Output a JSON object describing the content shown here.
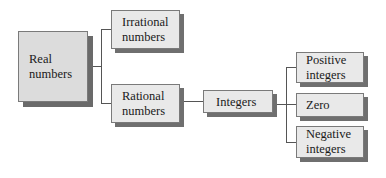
{
  "diagram": {
    "type": "tree",
    "nodes": {
      "real": {
        "line1": "Real",
        "line2": "numbers"
      },
      "irrational": {
        "line1": "Irrational",
        "line2": "numbers"
      },
      "rational": {
        "line1": "Rational",
        "line2": "numbers"
      },
      "integers": {
        "line1": "Integers"
      },
      "positive": {
        "line1": "Positive",
        "line2": "integers"
      },
      "zero": {
        "line1": "Zero"
      },
      "negative": {
        "line1": "Negative",
        "line2": "integers"
      }
    },
    "edges": [
      [
        "Real numbers",
        "Irrational numbers"
      ],
      [
        "Real numbers",
        "Rational numbers"
      ],
      [
        "Rational numbers",
        "Integers"
      ],
      [
        "Integers",
        "Positive integers"
      ],
      [
        "Integers",
        "Zero"
      ],
      [
        "Integers",
        "Negative integers"
      ]
    ],
    "colors": {
      "root_fill": "#dcdcdc",
      "node_fill": "#e9e9e9",
      "shadow": "#6f6f6f",
      "line": "#555555"
    }
  }
}
